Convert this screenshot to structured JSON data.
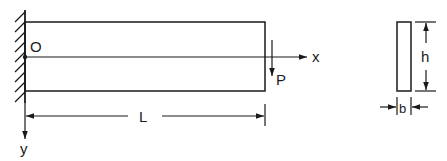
{
  "diagram": {
    "type": "cantilever-beam",
    "colors": {
      "ink": "#1a1a1a",
      "background": "#ffffff"
    },
    "labels": {
      "origin": "O",
      "x_axis": "x",
      "y_axis": "y",
      "load": "P",
      "length": "L",
      "height": "h",
      "width": "b"
    },
    "elements": [
      "fixed-wall-support",
      "beam-elevation",
      "neutral-axis",
      "point-load",
      "length-dimension",
      "cross-section",
      "height-dimension",
      "width-dimension"
    ]
  }
}
